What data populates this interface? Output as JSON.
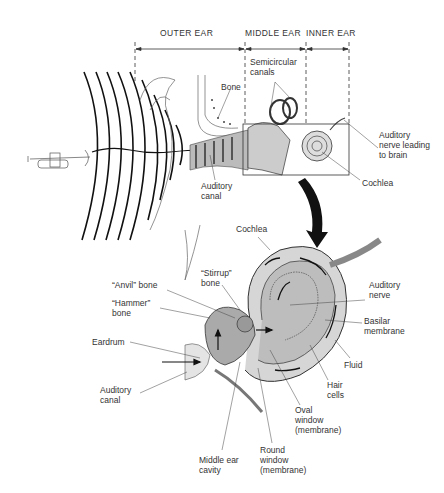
{
  "diagram": {
    "sections": [
      {
        "label": "OUTER EAR"
      },
      {
        "label": "MIDDLE EAR"
      },
      {
        "label": "INNER EAR"
      }
    ],
    "overview_labels": {
      "semicircular_canals": "Semicircular\ncanals",
      "bone": "Bone",
      "auditory_nerve": "Auditory\nnerve leading\nto brain",
      "cochlea": "Cochlea",
      "auditory_canal": "Auditory\ncanal"
    },
    "detail_labels": {
      "cochlea": "Cochlea",
      "stirrup": "“Stirrup”\nbone",
      "anvil": "“Anvil” bone",
      "hammer": "“Hammer”\nbone",
      "eardrum": "Eardrum",
      "auditory_canal": "Auditory\ncanal",
      "auditory_nerve": "Auditory\nnerve",
      "basilar_membrane": "Basilar\nmembrane",
      "fluid": "Fluid",
      "hair_cells": "Hair\ncells",
      "oval_window": "Oval\nwindow\n(membrane)",
      "round_window": "Round\nwindow\n(membrane)",
      "middle_ear_cavity": "Middle ear\ncavity"
    },
    "sound_source": "trumpet-icon"
  }
}
